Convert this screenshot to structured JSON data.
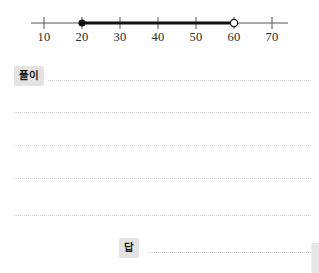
{
  "numberline": {
    "axis": {
      "x_start": 31,
      "x_end": 288,
      "y": 23
    },
    "ticks": [
      {
        "label": "10",
        "value": 10,
        "x": 44
      },
      {
        "label": "20",
        "value": 20,
        "x": 82
      },
      {
        "label": "30",
        "value": 30,
        "x": 120
      },
      {
        "label": "40",
        "value": 40,
        "x": 158
      },
      {
        "label": "50",
        "value": 50,
        "x": 196
      },
      {
        "label": "60",
        "value": 60,
        "x": 234
      },
      {
        "label": "70",
        "value": 70,
        "x": 272
      }
    ],
    "segment": {
      "start_value": 20,
      "end_value": 60,
      "start_x": 82,
      "end_x": 234,
      "start_marker": "closed-dot",
      "end_marker": "open-circle"
    },
    "colors": {
      "axis": "#555555",
      "segment": "#111111",
      "tick_label": "#2b2b2b",
      "marker_fill_open": "#ffffff"
    }
  },
  "worksheet": {
    "solution_label": "풀이",
    "answer_label": "답",
    "rule_lines": [
      {
        "x": 48,
        "y": 28,
        "width": 263
      },
      {
        "x": 14,
        "y": 60,
        "width": 297
      },
      {
        "x": 14,
        "y": 93,
        "width": 297
      },
      {
        "x": 14,
        "y": 126,
        "width": 297
      },
      {
        "x": 14,
        "y": 163,
        "width": 297
      },
      {
        "x": 148,
        "y": 200,
        "width": 163
      }
    ],
    "colors": {
      "tag_background": "#e3e3e3",
      "tag_text": "#1a1a1a",
      "rule_line": "#d2d2d2",
      "page_background": "#ffffff"
    }
  }
}
